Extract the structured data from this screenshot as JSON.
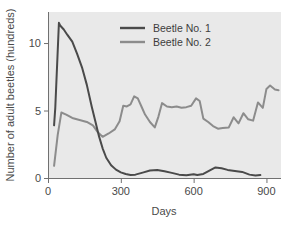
{
  "chart_data": {
    "type": "line",
    "title": "",
    "xlabel": "Days",
    "ylabel": "Number of adult beetles (hundreds)",
    "xlim": [
      0,
      960
    ],
    "ylim": [
      0,
      12.3
    ],
    "xticks": [
      0,
      300,
      600,
      900
    ],
    "xticklabels": [
      "0",
      "300",
      "600",
      "900"
    ],
    "yticks": [
      0,
      5,
      10
    ],
    "yticklabels": [
      "0",
      "5",
      "10"
    ],
    "grid": false,
    "legend_position": "top-center",
    "plot_background": "#e9e9e9",
    "series": [
      {
        "name": "Beetle No. 1",
        "color": "#4a4a4a",
        "linewidth": 2.0,
        "x": [
          25,
          30,
          45,
          50,
          65,
          80,
          100,
          120,
          140,
          160,
          180,
          195,
          210,
          225,
          240,
          260,
          280,
          300,
          320,
          340,
          360,
          390,
          420,
          450,
          480,
          510,
          540,
          570,
          600,
          615,
          640,
          665,
          690,
          715,
          740,
          770,
          800,
          830,
          855,
          875
        ],
        "y": [
          3.9,
          5.2,
          11.5,
          11.3,
          11.0,
          10.6,
          10.1,
          9.2,
          8.2,
          6.9,
          5.3,
          4.2,
          3.1,
          2.2,
          1.5,
          0.95,
          0.62,
          0.42,
          0.3,
          0.22,
          0.25,
          0.4,
          0.55,
          0.6,
          0.5,
          0.38,
          0.25,
          0.2,
          0.28,
          0.22,
          0.3,
          0.55,
          0.78,
          0.72,
          0.6,
          0.52,
          0.45,
          0.25,
          0.18,
          0.22
        ]
      },
      {
        "name": "Beetle No. 2",
        "color": "#8c8c8c",
        "linewidth": 2.0,
        "x": [
          25,
          40,
          55,
          75,
          100,
          130,
          160,
          185,
          205,
          225,
          250,
          275,
          295,
          310,
          325,
          340,
          355,
          370,
          385,
          400,
          420,
          440,
          455,
          470,
          490,
          510,
          530,
          550,
          570,
          590,
          610,
          625,
          640,
          660,
          680,
          700,
          720,
          745,
          765,
          785,
          805,
          825,
          845,
          865,
          885,
          900,
          915,
          935,
          950
        ],
        "y": [
          0.9,
          3.2,
          4.85,
          4.7,
          4.45,
          4.3,
          4.15,
          3.9,
          3.4,
          3.05,
          3.3,
          3.6,
          4.2,
          5.35,
          5.3,
          5.45,
          6.05,
          5.9,
          5.3,
          4.7,
          4.15,
          3.75,
          4.55,
          5.55,
          5.3,
          5.25,
          5.3,
          5.2,
          5.25,
          5.35,
          5.9,
          5.7,
          4.4,
          4.15,
          3.85,
          3.65,
          3.7,
          3.75,
          4.5,
          4.05,
          4.8,
          4.35,
          4.25,
          5.6,
          5.2,
          6.6,
          6.85,
          6.55,
          6.5
        ]
      }
    ]
  },
  "legend": {
    "entries": [
      {
        "label": "Beetle No. 1"
      },
      {
        "label": "Beetle No. 2"
      }
    ]
  }
}
